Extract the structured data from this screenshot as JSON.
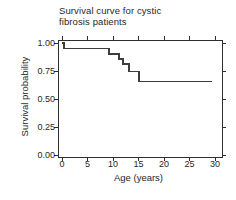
{
  "title": {
    "line1": "Survival curve for cystic",
    "line2": "fibrosis patients"
  },
  "colors": {
    "curve": "#3d3d3d",
    "frame": "#2e2e2e",
    "text": "#1f1f1f",
    "background": "#ffffff"
  },
  "chart_data": {
    "type": "line",
    "subtype": "kaplan-meier-step",
    "title": "Survival curve for cystic fibrosis patients",
    "xlabel": "Age (years)",
    "ylabel": "Survival probability",
    "xlim": [
      0,
      30
    ],
    "ylim": [
      0.0,
      1.0
    ],
    "x_ticks": [
      0,
      5,
      10,
      15,
      20,
      25,
      30
    ],
    "y_ticks": [
      "0.00",
      "0.25",
      "0.50",
      "0.75",
      "1.00"
    ],
    "grid": false,
    "legend": "none",
    "frame": "closed box with outward ticks on all four sides",
    "series": [
      {
        "name": "survival",
        "step_points": [
          {
            "age": 0.0,
            "prob": 1.0
          },
          {
            "age": 0.4,
            "prob": 0.95
          },
          {
            "age": 9.2,
            "prob": 0.9
          },
          {
            "age": 11.2,
            "prob": 0.855
          },
          {
            "age": 12.0,
            "prob": 0.81
          },
          {
            "age": 13.1,
            "prob": 0.745
          },
          {
            "age": 15.1,
            "prob": 0.655
          },
          {
            "age": 29.5,
            "prob": 0.655
          }
        ]
      }
    ]
  }
}
